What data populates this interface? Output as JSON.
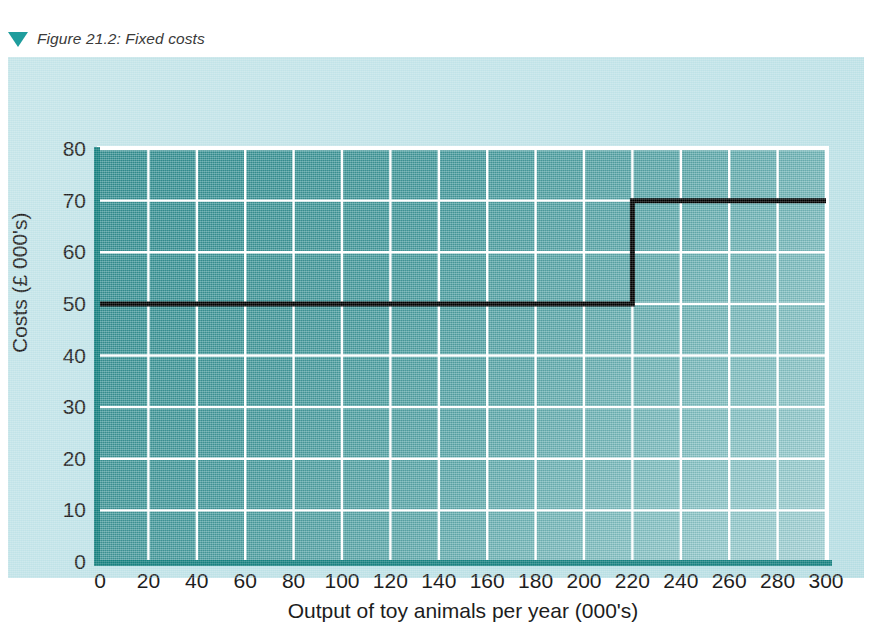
{
  "figure": {
    "marker_icon": "triangle-down-icon",
    "caption": "Figure 21.2: Fixed costs"
  },
  "colors": {
    "panel_light": "#bfe2e7",
    "plot_dark_teal": "#2f8d8f",
    "plot_light_teal": "#a4d3d6",
    "axis_teal": "#16807f",
    "gridline_white": "#ffffff",
    "series_black": "#000000",
    "marker_teal": "#1f9d9d",
    "text_dark": "#1d1d1d"
  },
  "chart_data": {
    "type": "line",
    "title": "Figure 21.2: Fixed costs",
    "xlabel": "Output of toy animals per year (000's)",
    "ylabel": "Costs (£ 000's)",
    "xlim": [
      0,
      300
    ],
    "ylim": [
      0,
      80
    ],
    "xticks": [
      0,
      20,
      40,
      60,
      80,
      100,
      120,
      140,
      160,
      180,
      200,
      220,
      240,
      260,
      280,
      300
    ],
    "yticks": [
      0,
      10,
      20,
      30,
      40,
      50,
      60,
      70,
      80
    ],
    "xtick_labels": [
      "0",
      "20",
      "40",
      "60",
      "80",
      "100",
      "120",
      "140",
      "160",
      "180",
      "200",
      "220",
      "240",
      "260",
      "280",
      "300"
    ],
    "ytick_labels": [
      "0",
      "10",
      "20",
      "30",
      "40",
      "50",
      "60",
      "70",
      "80"
    ],
    "grid": true,
    "grid_color": "#ffffff",
    "legend": false,
    "legend_position": "none",
    "series": [
      {
        "name": "Fixed costs",
        "style": "step",
        "color": "#000000",
        "line_width": 5,
        "points": [
          {
            "x": 0,
            "y": 50
          },
          {
            "x": 220,
            "y": 50
          },
          {
            "x": 220,
            "y": 70
          },
          {
            "x": 300,
            "y": 70
          }
        ]
      }
    ],
    "annotations": [
      {
        "text": "Step increase in fixed costs at output 220 (000's), from 50 to 70 (£ 000's)"
      }
    ]
  }
}
